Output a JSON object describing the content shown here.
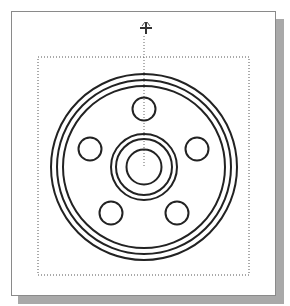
{
  "canvas": {
    "width": 290,
    "height": 306,
    "background": "#ffffff"
  },
  "sheet": {
    "border_color": "#8a8a8a",
    "shadow_color": "#a9a9a9"
  },
  "selection_box": {
    "x": 38,
    "y": 57,
    "width": 211,
    "height": 218,
    "style": "dotted",
    "color": "#555555"
  },
  "cursor": {
    "icon": "crosshair-move-cursor-icon",
    "x": 146,
    "y": 28
  },
  "drawing": {
    "title": "Flange / wheel front view",
    "stroke_color": "#222222",
    "center": {
      "x": 144,
      "y": 167
    },
    "outer_rings_r": [
      93,
      87,
      81
    ],
    "hub_rings_r": [
      33,
      28
    ],
    "bore_r": 17.5,
    "bolt_holes": [
      {
        "name": "top",
        "x": 144,
        "y": 109,
        "r": 11.5
      },
      {
        "name": "left",
        "x": 90,
        "y": 149,
        "r": 11.5
      },
      {
        "name": "right",
        "x": 197,
        "y": 149,
        "r": 11.5
      },
      {
        "name": "bottom-left",
        "x": 111,
        "y": 213,
        "r": 11.5
      },
      {
        "name": "bottom-right",
        "x": 177,
        "y": 213,
        "r": 11.5
      }
    ],
    "centerline": {
      "x": 144,
      "y1": 36,
      "y2": 167
    }
  }
}
